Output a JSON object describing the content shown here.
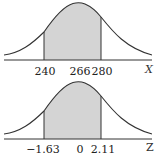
{
  "diagrams": [
    {
      "name": "x-distribution",
      "axis_label": "X",
      "ticks": [
        "240",
        "266",
        "280"
      ],
      "shaded_from": "240",
      "shaded_to": "280"
    },
    {
      "name": "z-distribution",
      "axis_label": "Z",
      "ticks": [
        "−1.63",
        "0",
        "2.11"
      ],
      "shaded_from": "−1.63",
      "shaded_to": "2.11"
    }
  ],
  "colors": {
    "shade": "#d4d4d4",
    "line": "#333333"
  }
}
